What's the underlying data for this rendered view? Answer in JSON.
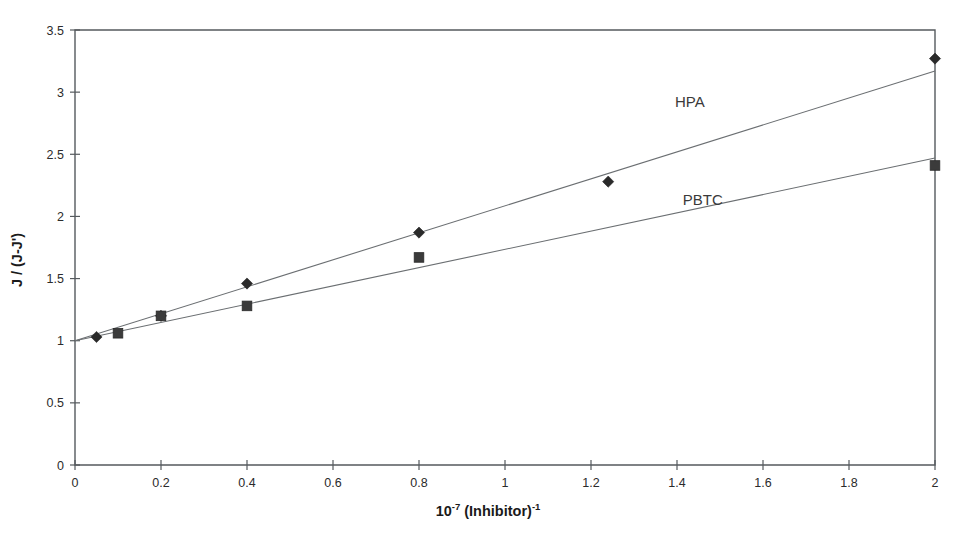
{
  "chart_data": {
    "type": "scatter",
    "title": "",
    "subtitle": "",
    "xlabel": "10-7 (Inhibitor)-1",
    "xlabel_base": "10",
    "xlabel_exp1": "-7",
    "xlabel_mid": " (Inhibitor)",
    "xlabel_exp2": "-1",
    "ylabel": "J / (J-J')",
    "xlim": [
      0,
      2
    ],
    "ylim": [
      0,
      3.5
    ],
    "xticks": [
      0,
      0.2,
      0.4,
      0.6,
      0.8,
      1,
      1.2,
      1.4,
      1.6,
      1.8,
      2
    ],
    "xticklabels": [
      "0",
      "0.2",
      "0.4",
      "0.6",
      "0.8",
      "1",
      "1.2",
      "1.4",
      "1.6",
      "1.8",
      "2"
    ],
    "yticks": [
      0,
      0.5,
      1,
      1.5,
      2,
      2.5,
      3,
      3.5
    ],
    "yticklabels": [
      "0",
      "0.5",
      "1",
      "1.5",
      "2",
      "2.5",
      "3",
      "3.5"
    ],
    "grid": false,
    "legend_position": "inline-annotation",
    "series": [
      {
        "name": "HPA",
        "marker": "diamond",
        "color": "#2a2a2a",
        "label_x": 1.43,
        "label_y": 2.88,
        "x": [
          0.05,
          0.2,
          0.4,
          0.8,
          1.24,
          2.0
        ],
        "y": [
          1.03,
          1.2,
          1.46,
          1.87,
          2.28,
          3.27
        ],
        "trendline": {
          "x": [
            0,
            2.0
          ],
          "y": [
            1.0,
            3.17
          ]
        }
      },
      {
        "name": "PBTC",
        "marker": "square",
        "color": "#3b3b3b",
        "label_x": 1.46,
        "label_y": 2.09,
        "x": [
          0.1,
          0.2,
          0.4,
          0.8,
          2.0
        ],
        "y": [
          1.06,
          1.2,
          1.28,
          1.67,
          2.41
        ],
        "trendline": {
          "x": [
            0,
            2.0
          ],
          "y": [
            1.0,
            2.47
          ]
        }
      }
    ]
  },
  "figure": {
    "axis_labels": {
      "y": "J / (J-J')",
      "x_full": "10-7 (Inhibitor)-1"
    }
  }
}
